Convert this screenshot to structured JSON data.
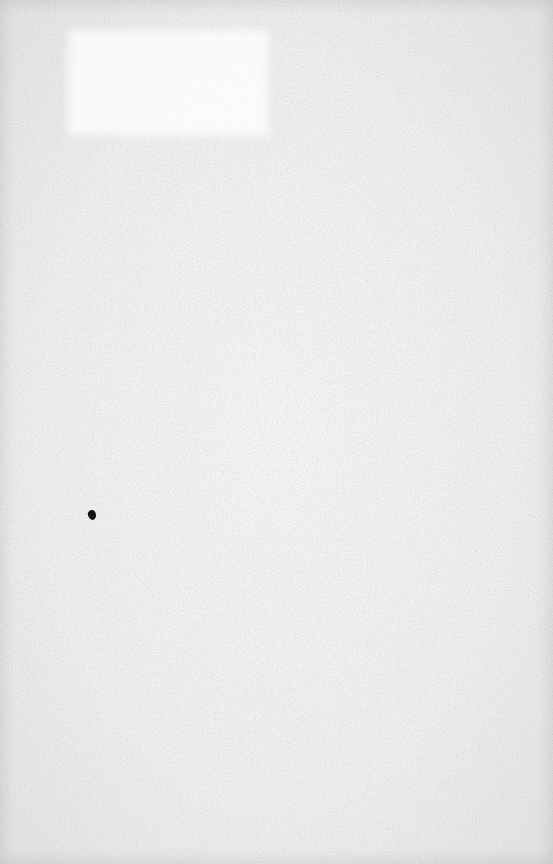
{
  "document": {
    "type": "blank-scanned-page",
    "text": "",
    "colors": {
      "paper": "#f2f2f2",
      "paper_edge": "#e4e4e4",
      "ink": "#111111"
    },
    "marks": [
      {
        "kind": "ink-blot",
        "x": 92,
        "y": 515
      }
    ]
  }
}
